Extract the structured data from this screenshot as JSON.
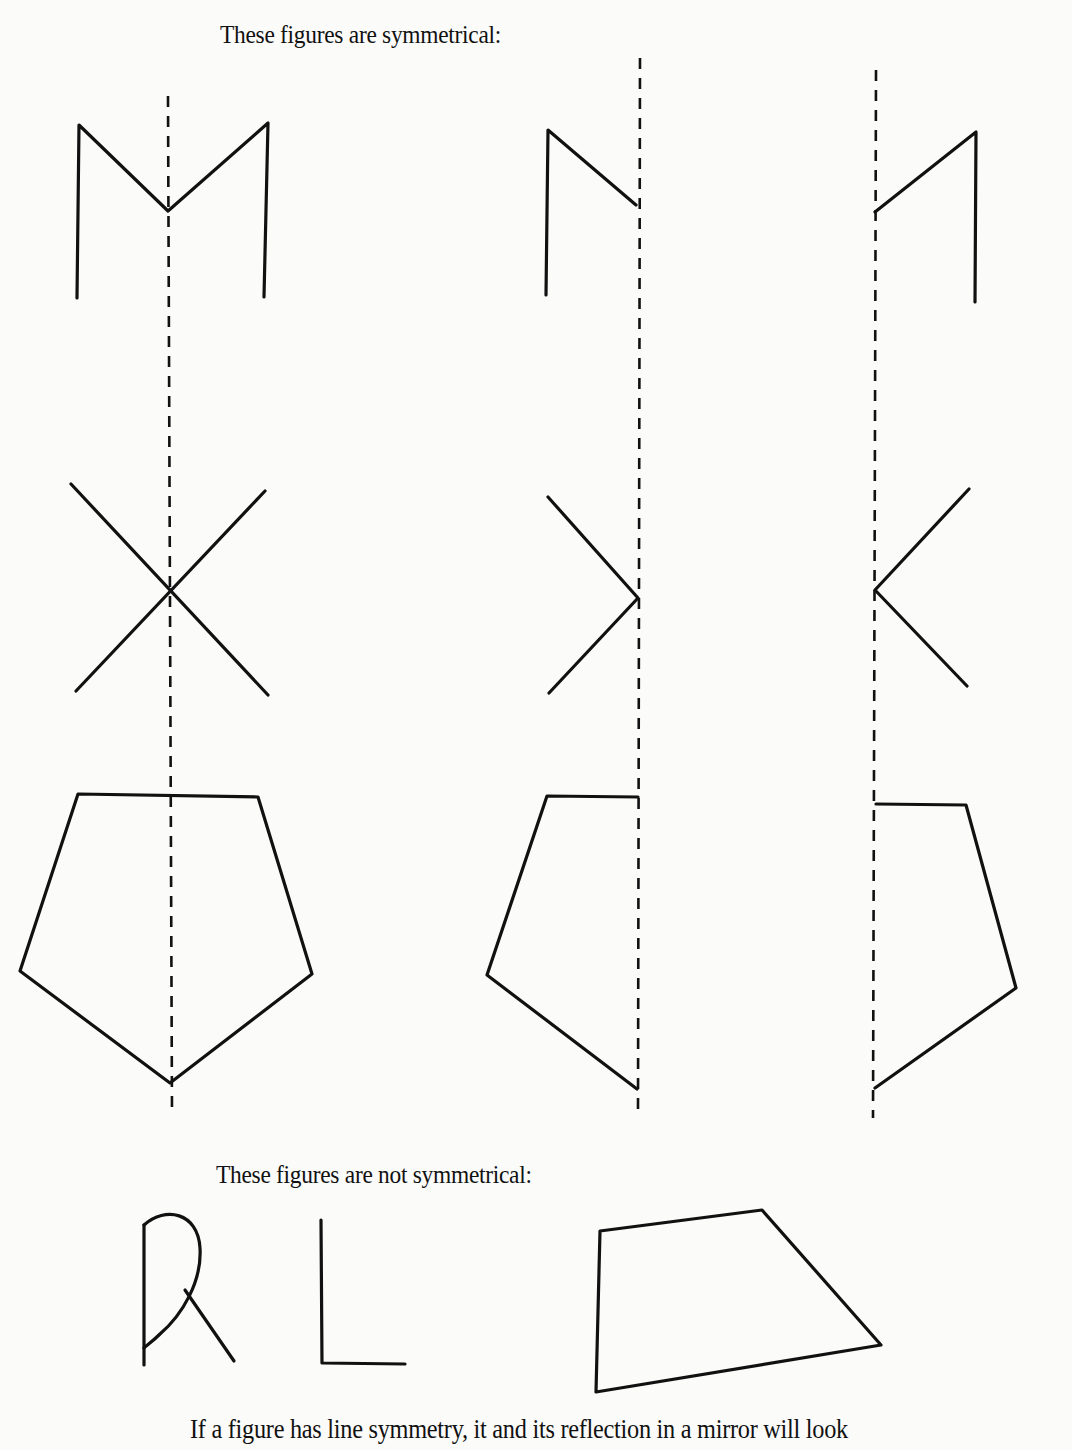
{
  "page": {
    "section_symmetrical": {
      "caption": "These figures are symmetrical:",
      "figures": [
        {
          "name": "M-shape",
          "variants": [
            "whole",
            "left half",
            "right half"
          ]
        },
        {
          "name": "X-shape",
          "variants": [
            "whole",
            "left half",
            "right half"
          ]
        },
        {
          "name": "pentagon",
          "variants": [
            "whole",
            "left half",
            "right half"
          ]
        }
      ]
    },
    "section_not_symmetrical": {
      "caption": "These figures are not symmetrical:",
      "figures": [
        "R",
        "L",
        "quadrilateral"
      ]
    },
    "body_text": "If a figure has line symmetry, it and its reflection in a mirror will look"
  }
}
